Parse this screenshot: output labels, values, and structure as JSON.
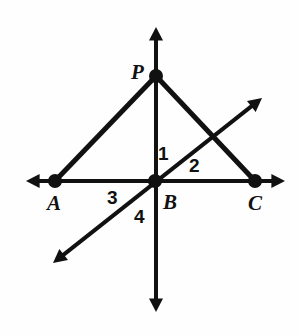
{
  "figure": {
    "background_color": "#fefefe",
    "stroke_color": "#111111",
    "point_color": "#111111",
    "canvas": {
      "width": 299,
      "height": 336
    }
  },
  "points": [
    {
      "id": "P",
      "label": "P",
      "x": 156,
      "y": 76,
      "label_x": 131,
      "label_y": 62,
      "dot_radius": 7
    },
    {
      "id": "A",
      "label": "A",
      "x": 55,
      "y": 181,
      "label_x": 47,
      "label_y": 193,
      "dot_radius": 7
    },
    {
      "id": "B",
      "label": "B",
      "x": 155,
      "y": 181,
      "label_x": 163,
      "label_y": 192,
      "dot_radius": 7
    },
    {
      "id": "C",
      "label": "C",
      "x": 255,
      "y": 181,
      "label_x": 248,
      "label_y": 193,
      "dot_radius": 7
    }
  ],
  "angle_labels": [
    {
      "id": "1",
      "label": "1",
      "x": 158,
      "y": 144
    },
    {
      "id": "2",
      "label": "2",
      "x": 189,
      "y": 156
    },
    {
      "id": "3",
      "label": "3",
      "x": 107,
      "y": 188
    },
    {
      "id": "4",
      "label": "4",
      "x": 134,
      "y": 207
    }
  ],
  "lines": [
    {
      "id": "horizontal-line-AC",
      "kind": "double-arrow-line",
      "x1": 26,
      "y1": 181,
      "x2": 285,
      "y2": 181,
      "arrow_start": true,
      "arrow_end": true,
      "stroke_width": 4
    },
    {
      "id": "vertical-line-through-P-B",
      "kind": "double-arrow-line",
      "x1": 156,
      "y1": 27,
      "x2": 156,
      "y2": 312,
      "arrow_start": true,
      "arrow_end": true,
      "stroke_width": 4
    },
    {
      "id": "diagonal-line-through-B",
      "kind": "double-arrow-line",
      "x1": 53,
      "y1": 263,
      "x2": 262,
      "y2": 98,
      "arrow_start": true,
      "arrow_end": true,
      "stroke_width": 4
    },
    {
      "id": "segment-PA",
      "kind": "segment",
      "x1": 156,
      "y1": 76,
      "x2": 55,
      "y2": 181,
      "arrow_start": false,
      "arrow_end": false,
      "stroke_width": 5
    },
    {
      "id": "segment-PC",
      "kind": "segment",
      "x1": 156,
      "y1": 76,
      "x2": 255,
      "y2": 181,
      "arrow_start": false,
      "arrow_end": false,
      "stroke_width": 5
    }
  ]
}
